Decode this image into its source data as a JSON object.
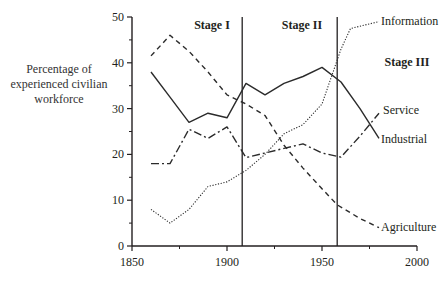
{
  "chart_data": {
    "type": "line",
    "title": "",
    "xlabel": "",
    "ylabel": "Percentage of experienced civilian workforce",
    "ylabel_lines": [
      "Percentage of",
      "experienced civilian",
      "workforce"
    ],
    "xlim": [
      1850,
      2000
    ],
    "ylim": [
      0,
      50
    ],
    "x_ticks": [
      1850,
      1900,
      1950,
      2000
    ],
    "x_minor_ticks": [
      1875,
      1925,
      1975
    ],
    "y_ticks": [
      0,
      10,
      20,
      30,
      40,
      50
    ],
    "y_minor_ticks": [
      5,
      15,
      25,
      35,
      45
    ],
    "grid": false,
    "legend": "inline labels at line ends",
    "stage_dividers": [
      1908,
      1958
    ],
    "stages": [
      {
        "label": "Stage I",
        "x": 1892,
        "y": 46.5
      },
      {
        "label": "Stage II",
        "x": 1940,
        "y": 46.5
      },
      {
        "label": "Stage III",
        "x": 1990,
        "y": 37.5
      }
    ],
    "series": [
      {
        "name": "Agriculture",
        "style": "dashed",
        "x": [
          1860,
          1870,
          1880,
          1890,
          1900,
          1910,
          1920,
          1930,
          1940,
          1950,
          1958,
          1970,
          1980
        ],
        "values": [
          41.5,
          46,
          42.5,
          38,
          33,
          31,
          28.5,
          22,
          17,
          12.5,
          9,
          6,
          4
        ]
      },
      {
        "name": "Industrial",
        "style": "solid",
        "x": [
          1860,
          1870,
          1880,
          1890,
          1900,
          1910,
          1920,
          1930,
          1940,
          1950,
          1960,
          1970,
          1980
        ],
        "values": [
          38,
          32.5,
          27,
          29,
          28,
          35.5,
          33,
          35.5,
          37,
          39,
          35.8,
          30,
          23.5
        ]
      },
      {
        "name": "Service",
        "style": "dash-dot",
        "x": [
          1860,
          1870,
          1880,
          1890,
          1900,
          1910,
          1920,
          1930,
          1940,
          1950,
          1960,
          1970,
          1980
        ],
        "values": [
          18,
          18,
          25.5,
          23.5,
          26,
          19.3,
          20.3,
          21.3,
          22.3,
          20.3,
          19.4,
          24,
          29
        ]
      },
      {
        "name": "Information",
        "style": "dotted",
        "x": [
          1860,
          1870,
          1880,
          1890,
          1900,
          1910,
          1920,
          1930,
          1940,
          1950,
          1960,
          1965,
          1980
        ],
        "values": [
          8,
          5,
          8,
          13,
          14,
          16.5,
          20,
          24.5,
          26.5,
          31,
          43,
          47.5,
          49
        ]
      }
    ]
  },
  "labels": {
    "ylabel_line1": "Percentage of",
    "ylabel_line2": "experienced civilian",
    "ylabel_line3": "workforce",
    "series": {
      "information": "Information",
      "service": "Service",
      "industrial": "Industrial",
      "agriculture": "Agriculture"
    },
    "stages": {
      "stage1": "Stage I",
      "stage2": "Stage II",
      "stage3": "Stage III"
    },
    "x_ticks": [
      "1850",
      "1900",
      "1950",
      "2000"
    ],
    "y_ticks": [
      "0",
      "10",
      "20",
      "30",
      "40",
      "50"
    ]
  },
  "colors": {
    "axis": "#231f20",
    "line": "#2b2b2b",
    "text": "#231f20"
  }
}
